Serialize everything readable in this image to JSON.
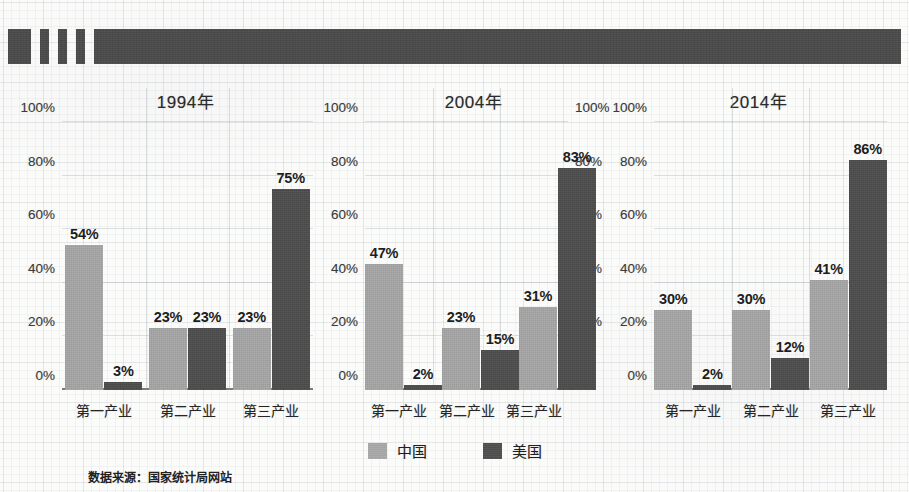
{
  "page": {
    "background_color": "#fbfbfa",
    "header_band_color": "#4a4a4a"
  },
  "header_band": {
    "segments": [
      {
        "name": "block-1",
        "width": 23
      },
      {
        "name": "gap-1",
        "width": 9
      },
      {
        "name": "bar-1",
        "width": 9
      },
      {
        "name": "gap-2",
        "width": 9
      },
      {
        "name": "bar-2",
        "width": 9
      },
      {
        "name": "gap-3",
        "width": 9
      },
      {
        "name": "bar-3",
        "width": 9
      },
      {
        "name": "gap-4",
        "width": 9
      },
      {
        "name": "long-bar",
        "width": 807
      }
    ]
  },
  "legend": {
    "items": [
      {
        "label": "中国",
        "color": "#a3a3a3",
        "key": "cn"
      },
      {
        "label": "美国",
        "color": "#4d4d4d",
        "key": "us"
      }
    ]
  },
  "source_note": "数据来源：国家统计局网站",
  "chart_data": [
    {
      "type": "bar",
      "title": "1994年",
      "xlabel": "",
      "ylabel": "",
      "ylim": [
        0,
        100
      ],
      "yticks": [
        "0%",
        "20%",
        "40%",
        "60%",
        "80%",
        "100%"
      ],
      "ytick_values": [
        0,
        20,
        40,
        60,
        80,
        100
      ],
      "grid": true,
      "legend_position": "bottom-center",
      "categories": [
        "第一产业",
        "第二产业",
        "第三产业"
      ],
      "series": [
        {
          "name": "中国",
          "color": "#a3a3a3",
          "values": [
            54,
            23,
            23
          ],
          "labels": [
            "54%",
            "23%",
            "23%"
          ]
        },
        {
          "name": "美国",
          "color": "#4d4d4d",
          "values": [
            3,
            23,
            75
          ],
          "labels": [
            "3%",
            "23%",
            "75%"
          ]
        }
      ]
    },
    {
      "type": "bar",
      "title": "2004年",
      "xlabel": "",
      "ylabel": "",
      "ylim": [
        0,
        100
      ],
      "yticks": [
        "0%",
        "20%",
        "40%",
        "60%",
        "80%",
        "100%"
      ],
      "ytick_values": [
        0,
        20,
        40,
        60,
        80,
        100
      ],
      "grid": true,
      "legend_position": "bottom-center",
      "categories": [
        "第一产业",
        "第二产业",
        "第三产业"
      ],
      "series": [
        {
          "name": "中国",
          "color": "#a3a3a3",
          "values": [
            47,
            23,
            31
          ],
          "labels": [
            "47%",
            "23%",
            "31%"
          ]
        },
        {
          "name": "美国",
          "color": "#4d4d4d",
          "values": [
            2,
            15,
            83
          ],
          "labels": [
            "2%",
            "15%",
            "83%"
          ]
        }
      ]
    },
    {
      "type": "bar",
      "title": "2014年",
      "xlabel": "",
      "ylabel": "",
      "ylim": [
        0,
        100
      ],
      "yticks": [
        "0%",
        "20%",
        "40%",
        "60%",
        "80%",
        "100%"
      ],
      "ytick_values": [
        0,
        20,
        40,
        60,
        80,
        100
      ],
      "grid": true,
      "legend_position": "bottom-center",
      "categories": [
        "第一产业",
        "第二产业",
        "第三产业"
      ],
      "series": [
        {
          "name": "中国",
          "color": "#a3a3a3",
          "values": [
            30,
            30,
            41
          ],
          "labels": [
            "30%",
            "30%",
            "41%"
          ]
        },
        {
          "name": "美国",
          "color": "#4d4d4d",
          "values": [
            2,
            12,
            86
          ],
          "labels": [
            "2%",
            "12%",
            "86%"
          ]
        }
      ]
    }
  ]
}
